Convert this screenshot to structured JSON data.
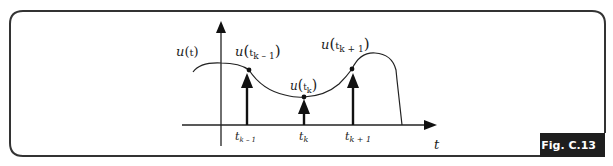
{
  "figure": {
    "caption": "Fig. C.13",
    "colors": {
      "frame": "#333333",
      "ink": "#222222",
      "tab_bg": "#1e1e1e",
      "tab_text": "#ffffff"
    }
  },
  "labels": {
    "u_t": {
      "func": "u",
      "open": "(",
      "arg": "t",
      "close": ")"
    },
    "u_tk_minus": {
      "func": "u",
      "open": "(",
      "arg": "t",
      "sub": "k – 1",
      "close": ")"
    },
    "u_tk": {
      "func": "u",
      "open": "(",
      "arg": "t",
      "sub": "k",
      "close": ")"
    },
    "u_tk_plus": {
      "func": "u",
      "open": "(",
      "arg": "t",
      "sub": "k + 1",
      "close": ")"
    }
  },
  "axis": {
    "x_label": "t",
    "ticks": [
      {
        "main": "t",
        "sub": "k – 1"
      },
      {
        "main": "t",
        "sub": "k"
      },
      {
        "main": "t",
        "sub": "k + 1"
      }
    ]
  }
}
